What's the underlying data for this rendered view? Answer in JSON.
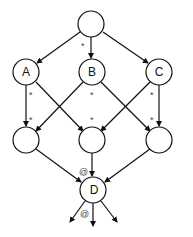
{
  "diagram": {
    "nodes": [
      {
        "id": "top",
        "label": "",
        "x": 91,
        "y": 24
      },
      {
        "id": "A",
        "label": "A",
        "x": 26,
        "y": 72
      },
      {
        "id": "B",
        "label": "B",
        "x": 92,
        "y": 72
      },
      {
        "id": "C",
        "label": "C",
        "x": 159,
        "y": 72
      },
      {
        "id": "L",
        "label": "",
        "x": 26,
        "y": 140
      },
      {
        "id": "M",
        "label": "",
        "x": 92,
        "y": 140
      },
      {
        "id": "R",
        "label": "",
        "x": 159,
        "y": 140
      },
      {
        "id": "D",
        "label": "D",
        "x": 93,
        "y": 190
      }
    ],
    "edges": [
      {
        "from": "top",
        "to": "A"
      },
      {
        "from": "top",
        "to": "B"
      },
      {
        "from": "top",
        "to": "C"
      },
      {
        "from": "A",
        "to": "L"
      },
      {
        "from": "A",
        "to": "M"
      },
      {
        "from": "B",
        "to": "L"
      },
      {
        "from": "B",
        "to": "R"
      },
      {
        "from": "C",
        "to": "M"
      },
      {
        "from": "C",
        "to": "R"
      },
      {
        "from": "L",
        "to": "D"
      },
      {
        "from": "M",
        "to": "D"
      },
      {
        "from": "R",
        "to": "D"
      }
    ],
    "annotations": [
      {
        "text": "*",
        "x": 81,
        "y": 46
      },
      {
        "text": "*",
        "x": 31,
        "y": 98
      },
      {
        "text": "*",
        "x": 92,
        "y": 98
      },
      {
        "text": "*",
        "x": 151,
        "y": 98
      },
      {
        "text": "*",
        "x": 31,
        "y": 121
      },
      {
        "text": "*",
        "x": 92,
        "y": 121
      },
      {
        "text": "*",
        "x": 151,
        "y": 121
      },
      {
        "text": "*",
        "x": 31,
        "y": 121
      },
      {
        "text": "@",
        "x": 79,
        "y": 176
      },
      {
        "text": "@",
        "x": 81,
        "y": 217
      }
    ],
    "labels": {
      "A": "A",
      "B": "B",
      "C": "C",
      "D": "D",
      "star": "*",
      "at": "@"
    }
  }
}
